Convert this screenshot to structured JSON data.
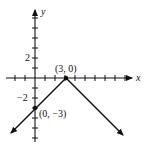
{
  "chart_data": {
    "type": "line",
    "title": "",
    "xlabel": "x",
    "ylabel": "y",
    "function": "y = -|x - 3|",
    "series": [
      {
        "name": "graph",
        "points": [
          [
            -2.4,
            -5.4
          ],
          [
            0,
            -3
          ],
          [
            3,
            0
          ],
          [
            8.7,
            -5.7
          ]
        ],
        "arrows": "both-ends"
      }
    ],
    "annotations": [
      {
        "label": "(3, 0)",
        "x": 3,
        "y": 0
      },
      {
        "label": "(0, -3)",
        "x": 0,
        "y": -3
      }
    ],
    "y_tick_labels": [
      {
        "value": 2,
        "label": "2"
      },
      {
        "value": -2,
        "label": "−2"
      }
    ],
    "xlim": [
      -2.5,
      9.5
    ],
    "ylim": [
      -6,
      6.5
    ],
    "tick_interval": 1,
    "grid": false
  },
  "labels": {
    "x_axis": "x",
    "y_axis": "y",
    "tick_pos2": "2",
    "tick_neg2": "−2",
    "vertex": "(3, 0)",
    "y_intercept": "(0, −3)"
  }
}
